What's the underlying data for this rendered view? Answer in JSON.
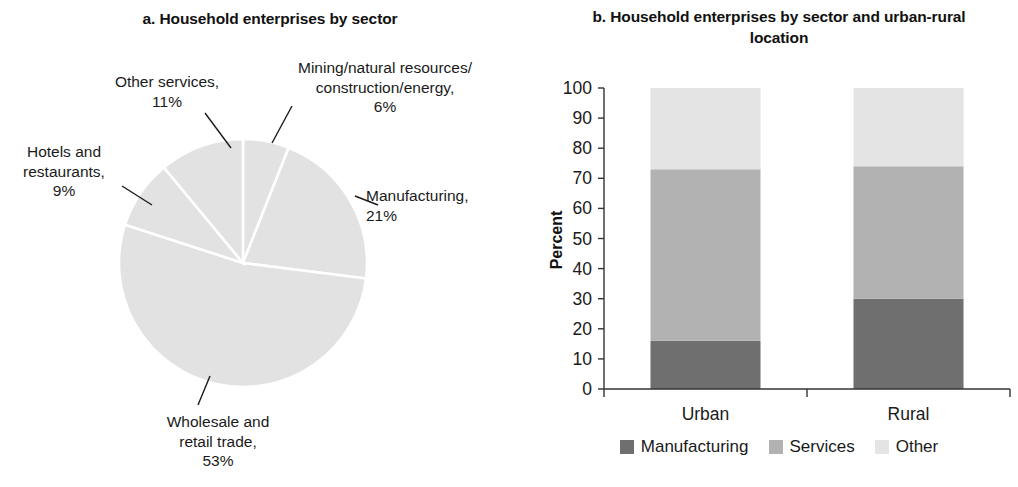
{
  "panel_a": {
    "title": "a. Household enterprises by sector",
    "labels": {
      "other_services": "Other services,\n11%",
      "mining": "Mining/natural resources/\nconstruction/energy,\n6%",
      "hotels": "Hotels and\nrestaurants,\n9%",
      "manufacturing": "Manufacturing,\n21%",
      "wholesale": "Wholesale and\nretail trade,\n53%"
    }
  },
  "panel_b": {
    "title": "b. Household enterprises by sector and urban-rural location",
    "ylabel": "Percent",
    "legend": [
      {
        "label": "Manufacturing",
        "color": "#6f6f6f"
      },
      {
        "label": "Services",
        "color": "#b2b2b2"
      },
      {
        "label": "Other",
        "color": "#e4e4e4"
      }
    ]
  },
  "chart_data": [
    {
      "type": "pie",
      "title": "a. Household enterprises by sector",
      "categories": [
        "Mining/natural resources/construction/energy",
        "Manufacturing",
        "Wholesale and retail trade",
        "Hotels and restaurants",
        "Other services"
      ],
      "values": [
        6,
        21,
        53,
        9,
        11
      ],
      "units": "percent",
      "slice_color": "#e2e2e2",
      "separator_color": "#ffffff",
      "start_angle_deg": 0,
      "direction": "clockwise",
      "legend": "labels-outside-with-leader-lines"
    },
    {
      "type": "bar",
      "subtype": "stacked-100",
      "title": "b. Household enterprises by sector and urban-rural location",
      "xlabel": "",
      "ylabel": "Percent",
      "categories": [
        "Urban",
        "Rural"
      ],
      "ylim": [
        0,
        100
      ],
      "yticks": [
        0,
        10,
        20,
        30,
        40,
        50,
        60,
        70,
        80,
        90,
        100
      ],
      "grid": false,
      "legend_position": "bottom",
      "series": [
        {
          "name": "Manufacturing",
          "color": "#6f6f6f",
          "values": [
            16,
            30
          ]
        },
        {
          "name": "Services",
          "color": "#b2b2b2",
          "values": [
            57,
            44
          ]
        },
        {
          "name": "Other",
          "color": "#e4e4e4",
          "values": [
            27,
            26
          ]
        }
      ]
    }
  ]
}
